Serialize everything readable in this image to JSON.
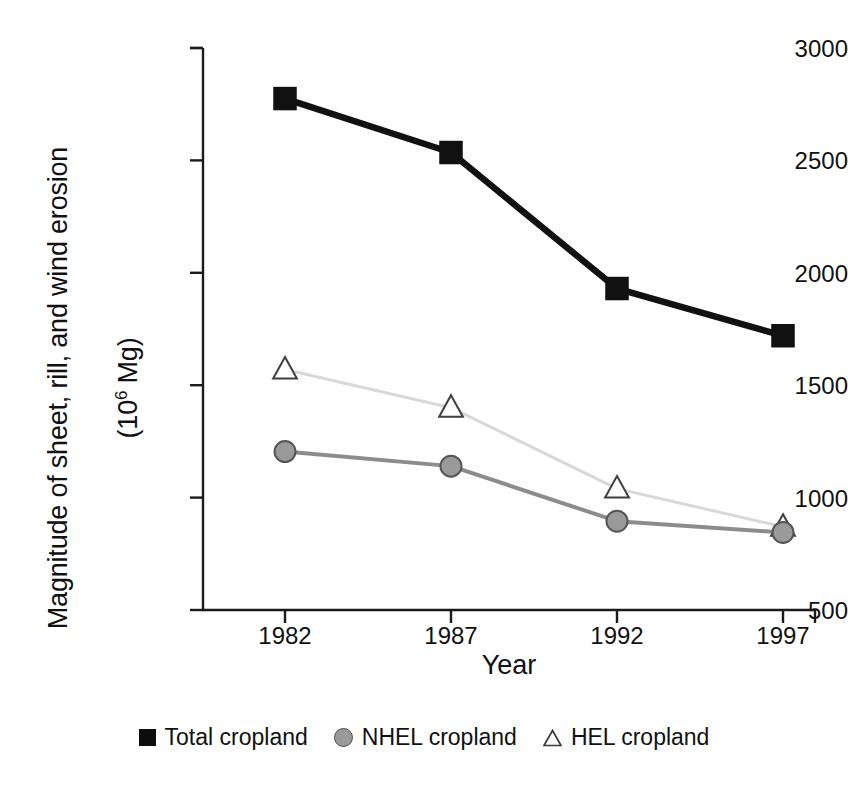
{
  "chart_data": {
    "type": "line",
    "title": "",
    "xlabel": "Year",
    "ylabel": "Magnitude of sheet, rill, and wind erosion (10⁶ Mg)",
    "ylabel_line1": "Magnitude of sheet, rill, and wind erosion",
    "ylabel_line2_prefix": "(10",
    "ylabel_line2_sup": "6",
    "ylabel_line2_suffix": " Mg)",
    "categories": [
      "1982",
      "1987",
      "1992",
      "1997"
    ],
    "x": [
      1982,
      1987,
      1992,
      1997
    ],
    "xlim": [
      1980,
      1999
    ],
    "ylim": [
      500,
      3000
    ],
    "yticks": [
      3000,
      2500,
      2000,
      1500,
      1000,
      500
    ],
    "ytick_labels": [
      "3000",
      "2500",
      "2000",
      "1500",
      "1000",
      "500"
    ],
    "xticks": [
      1982,
      1987,
      1992,
      1997
    ],
    "xtick_labels": [
      "1982",
      "1987",
      "1992",
      "1997"
    ],
    "grid": false,
    "legend_position": "bottom",
    "series": [
      {
        "name": "Total cropland",
        "marker": "square-filled",
        "color": "#111111",
        "line_color": "#111111",
        "values": [
          2775,
          2535,
          1930,
          1720
        ]
      },
      {
        "name": "NHEL cropland",
        "marker": "circle-gray",
        "color": "#9a9a9a",
        "line_color": "#8c8c8c",
        "values": [
          1205,
          1140,
          895,
          845
        ]
      },
      {
        "name": "HEL cropland",
        "marker": "triangle-open",
        "color": "#ffffff",
        "line_color": "#d8d8d8",
        "values": [
          1570,
          1400,
          1040,
          870
        ]
      }
    ]
  },
  "legend": {
    "items": [
      {
        "label": "Total cropland",
        "marker": "square-filled"
      },
      {
        "label": "NHEL cropland",
        "marker": "circle-gray"
      },
      {
        "label": "HEL cropland",
        "marker": "triangle-open"
      }
    ]
  },
  "axis": {
    "x_title": "Year",
    "y_title_line1": "Magnitude of sheet, rill, and wind erosion",
    "y_title_line2": "(10⁶ Mg)"
  }
}
